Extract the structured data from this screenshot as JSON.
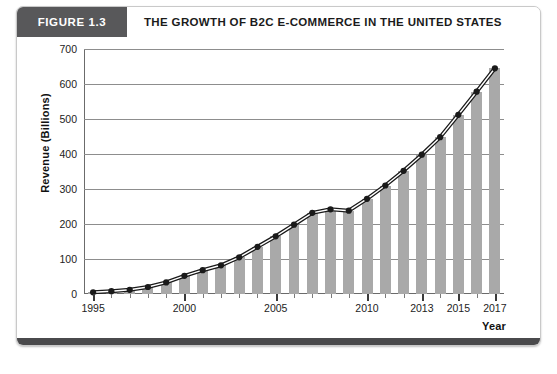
{
  "figure": {
    "badge": "FIGURE 1.3",
    "title": "THE GROWTH OF B2C E-COMMERCE IN THE UNITED STATES"
  },
  "colors": {
    "badge_bg": "#58585a",
    "bar": "#a9a9a9",
    "line": "#1a1a1a",
    "grid": "#8d8d8d",
    "axis": "#6b6b6b",
    "bottom_bar": "#4a4a4c"
  },
  "chart_data": {
    "type": "bar",
    "title": "THE GROWTH OF B2C E-COMMERCE IN THE UNITED STATES",
    "xlabel": "Year",
    "ylabel": "Revenue (Billions)",
    "ylim": [
      0,
      700
    ],
    "yticks": [
      0,
      100,
      200,
      300,
      400,
      500,
      600,
      700
    ],
    "grid": true,
    "legend": "none",
    "categories": [
      "1995",
      "1996",
      "1997",
      "1998",
      "1999",
      "2000",
      "2001",
      "2002",
      "2003",
      "2004",
      "2005",
      "2006",
      "2007",
      "2008",
      "2009",
      "2010",
      "2011",
      "2012",
      "2013",
      "2014",
      "2015",
      "2016",
      "2017"
    ],
    "xtick_labels": [
      "1995",
      "2000",
      "2005",
      "2010",
      "2013",
      "2015",
      "2017"
    ],
    "series": [
      {
        "name": "Revenue (Billions)",
        "type": "bar",
        "values": [
          5,
          8,
          12,
          20,
          33,
          52,
          68,
          82,
          105,
          135,
          165,
          198,
          232,
          242,
          238,
          272,
          310,
          352,
          398,
          448,
          512,
          578,
          645
        ]
      },
      {
        "name": "Revenue trend",
        "type": "line",
        "marker": "circle",
        "values": [
          5,
          8,
          12,
          20,
          33,
          52,
          68,
          82,
          105,
          135,
          165,
          198,
          232,
          242,
          238,
          272,
          310,
          352,
          398,
          448,
          512,
          578,
          645
        ]
      }
    ]
  }
}
